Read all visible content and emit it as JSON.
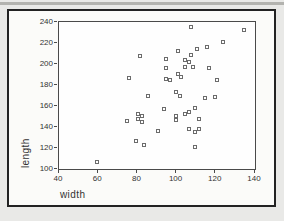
{
  "figure": {
    "kind": "scatter-plot-figure",
    "colors": {
      "page_bg": "#e9e9e7",
      "top_strip": "#b3b3af",
      "card_bg": "#fbfbf9",
      "card_border": "#222222",
      "plot_frame": "#4a4a4a",
      "marker_border": "#6b6b6b",
      "text": "#333333"
    }
  },
  "chart_data": {
    "type": "scatter",
    "title": "",
    "xlabel": "width",
    "ylabel": "length",
    "xlim": [
      40,
      140
    ],
    "ylim": [
      100,
      240
    ],
    "xticks": [
      40,
      60,
      80,
      100,
      120,
      140
    ],
    "yticks": [
      100,
      120,
      140,
      160,
      180,
      200,
      220,
      240
    ],
    "grid": false,
    "legend": false,
    "marker": "open-square",
    "points": [
      [
        60,
        106
      ],
      [
        75,
        145
      ],
      [
        76,
        186
      ],
      [
        80,
        126
      ],
      [
        81,
        151
      ],
      [
        81,
        147
      ],
      [
        82,
        207
      ],
      [
        83,
        150
      ],
      [
        83,
        144
      ],
      [
        84,
        122
      ],
      [
        86,
        169
      ],
      [
        91,
        135
      ],
      [
        94,
        156
      ],
      [
        95,
        204
      ],
      [
        95,
        195
      ],
      [
        95,
        185
      ],
      [
        97,
        184
      ],
      [
        100,
        172
      ],
      [
        100,
        150
      ],
      [
        100,
        146
      ],
      [
        101,
        211
      ],
      [
        101,
        190
      ],
      [
        102,
        169
      ],
      [
        103,
        187
      ],
      [
        105,
        203
      ],
      [
        105,
        196
      ],
      [
        105,
        151
      ],
      [
        107,
        201
      ],
      [
        107,
        153
      ],
      [
        107,
        137
      ],
      [
        108,
        234
      ],
      [
        108,
        208
      ],
      [
        109,
        196
      ],
      [
        110,
        157
      ],
      [
        110,
        134
      ],
      [
        110,
        120
      ],
      [
        111,
        213
      ],
      [
        112,
        147
      ],
      [
        112,
        137
      ],
      [
        115,
        167
      ],
      [
        116,
        215
      ],
      [
        117,
        195
      ],
      [
        120,
        168
      ],
      [
        121,
        184
      ],
      [
        124,
        220
      ],
      [
        135,
        231
      ]
    ]
  }
}
